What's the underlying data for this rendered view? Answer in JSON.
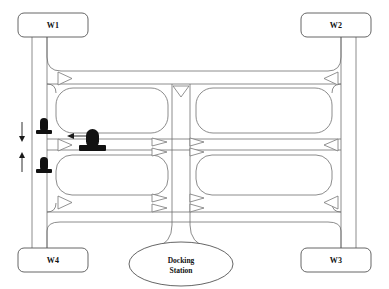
{
  "diagram": {
    "colors": {
      "aisle_stroke": "#6e6e6e",
      "station_stroke": "#555555",
      "robot_fill": "#111111",
      "arrow": "#1a1a1a",
      "background": "#ffffff"
    },
    "stations": [
      {
        "id": "W1",
        "label": "W1",
        "x": 60,
        "y": 25,
        "width": 64,
        "height": 24,
        "corner": "top-left"
      },
      {
        "id": "W2",
        "label": "W2",
        "x": 348,
        "y": 25,
        "width": 64,
        "height": 24,
        "corner": "top-right"
      },
      {
        "id": "W3",
        "label": "W3",
        "x": 348,
        "y": 258,
        "width": 64,
        "height": 24,
        "corner": "bottom-right"
      },
      {
        "id": "W4",
        "label": "W4",
        "x": 60,
        "y": 258,
        "width": 64,
        "height": 24,
        "corner": "bottom-left"
      }
    ],
    "docking_station": {
      "id": "dock",
      "label_line1": "Docking",
      "label_line2": "Station",
      "cx": 190,
      "cy": 264,
      "rx": 52,
      "ry": 22
    },
    "shelves": [
      {
        "id": "shelf-top-left",
        "x": 56,
        "y": 88,
        "width": 112,
        "height": 45
      },
      {
        "id": "shelf-top-right",
        "x": 196,
        "y": 88,
        "width": 136,
        "height": 45
      },
      {
        "id": "shelf-bottom-left",
        "x": 56,
        "y": 155,
        "width": 112,
        "height": 40
      },
      {
        "id": "shelf-bottom-right",
        "x": 196,
        "y": 155,
        "width": 136,
        "height": 40
      }
    ],
    "robots": [
      {
        "id": "robot-upper-left",
        "x": 44,
        "y": 130,
        "size": "small",
        "label": ""
      },
      {
        "id": "robot-center",
        "x": 93,
        "y": 143,
        "size": "large",
        "label": ""
      },
      {
        "id": "robot-lower-left",
        "x": 44,
        "y": 169,
        "size": "small",
        "label": ""
      }
    ],
    "direction_markers": [
      {
        "id": "marker-nw-top",
        "x": 66,
        "y": 78,
        "dir": "right"
      },
      {
        "id": "marker-ne-top",
        "x": 330,
        "y": 78,
        "dir": "left"
      },
      {
        "id": "marker-center-top",
        "x": 180,
        "y": 90,
        "dir": "down"
      },
      {
        "id": "marker-w-mid",
        "x": 66,
        "y": 145,
        "dir": "right"
      },
      {
        "id": "marker-midleft-a",
        "x": 156,
        "y": 142,
        "dir": "right"
      },
      {
        "id": "marker-midleft-b",
        "x": 156,
        "y": 152,
        "dir": "right"
      },
      {
        "id": "marker-midright-a",
        "x": 190,
        "y": 142,
        "dir": "right"
      },
      {
        "id": "marker-midright-b",
        "x": 190,
        "y": 152,
        "dir": "right"
      },
      {
        "id": "marker-e-mid",
        "x": 330,
        "y": 145,
        "dir": "left"
      },
      {
        "id": "marker-sw-bot",
        "x": 66,
        "y": 202,
        "dir": "right"
      },
      {
        "id": "marker-botleft-a",
        "x": 156,
        "y": 198,
        "dir": "right"
      },
      {
        "id": "marker-botleft-b",
        "x": 156,
        "y": 208,
        "dir": "right"
      },
      {
        "id": "marker-botright-a",
        "x": 190,
        "y": 198,
        "dir": "right"
      },
      {
        "id": "marker-botright-b",
        "x": 190,
        "y": 208,
        "dir": "right"
      },
      {
        "id": "marker-se-bot",
        "x": 330,
        "y": 202,
        "dir": "left"
      }
    ],
    "flow_arrows": [
      {
        "id": "flow-down-left",
        "orientation": "vertical",
        "dir": "down",
        "x": 22,
        "y1": 122,
        "y2": 140
      },
      {
        "id": "flow-up-left",
        "orientation": "vertical",
        "dir": "up",
        "x": 22,
        "y1": 170,
        "y2": 152
      },
      {
        "id": "flow-left-center",
        "orientation": "horizontal",
        "dir": "left",
        "x1": 95,
        "x2": 70,
        "y": 136
      }
    ]
  }
}
